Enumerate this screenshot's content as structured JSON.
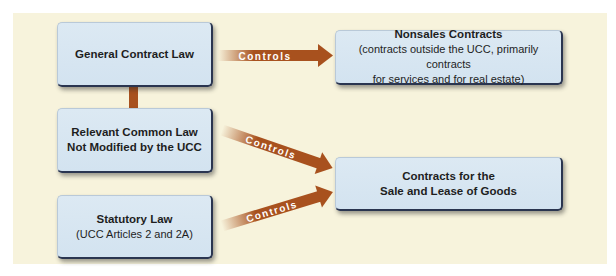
{
  "diagram": {
    "boxes": {
      "general_contract_law": {
        "title": "General Contract Law"
      },
      "nonsales_contracts": {
        "title": "Nonsales Contracts",
        "subtitle_line1": "(contracts outside the UCC, primarily contracts",
        "subtitle_line2": "for services and for real estate)"
      },
      "relevant_common_law": {
        "title_line1": "Relevant Common Law",
        "title_line2": "Not Modified by the UCC"
      },
      "sale_lease_goods": {
        "title_line1": "Contracts for the",
        "title_line2": "Sale and Lease of Goods"
      },
      "statutory_law": {
        "title": "Statutory Law",
        "subtitle": "(UCC Articles 2 and 2A)"
      }
    },
    "arrows": [
      {
        "from": "General Contract Law",
        "to": "Nonsales Contracts",
        "label": "Controls"
      },
      {
        "from": "Relevant Common Law Not Modified by the UCC",
        "to": "Contracts for the Sale and Lease of Goods",
        "label": "Controls"
      },
      {
        "from": "Statutory Law",
        "to": "Contracts for the Sale and Lease of Goods",
        "label": "Controls"
      }
    ],
    "colors": {
      "background": "#f7f3dc",
      "box_fill": "#d8e6f2",
      "box_border": "#2a3550",
      "arrow": "#a8511e",
      "arrow_label": "#ffffff"
    }
  }
}
